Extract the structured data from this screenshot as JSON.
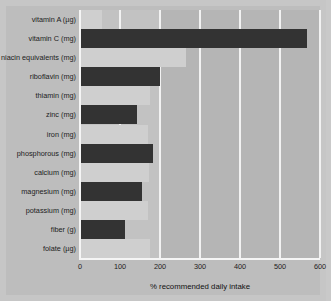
{
  "chart_data": {
    "type": "bar",
    "orientation": "horizontal",
    "title": "",
    "xlabel": "% recommended daily intake",
    "ylabel": "",
    "xlim": [
      0,
      600
    ],
    "xticks": [
      0,
      100,
      200,
      300,
      400,
      500,
      600
    ],
    "grid": true,
    "legend": "none",
    "categories": [
      "vitamin A (µg)",
      "vitamin C (mg)",
      "niacin equivalents (mg)",
      "riboflavin (mg)",
      "thiamin (mg)",
      "zinc (mg)",
      "iron (mg)",
      "phosphorous (mg)",
      "calcium (mg)",
      "magnesium (mg)",
      "potassium (mg)",
      "fiber (g)",
      "folate (µg)"
    ],
    "values": [
      55,
      568,
      265,
      200,
      175,
      143,
      170,
      183,
      172,
      155,
      170,
      112,
      175
    ],
    "bar_shades": [
      "light",
      "dark",
      "light",
      "dark",
      "light",
      "dark",
      "light",
      "dark",
      "light",
      "dark",
      "light",
      "dark",
      "light"
    ],
    "colors": {
      "dark_bar": "#333333",
      "light_bar": "#cfcfcf",
      "plot_background": "#b5b5b5",
      "band_background": "#c2c2c2",
      "gridline": "#f2f2f2",
      "page_background": "#bdbdbd",
      "text": "#1c1c1c"
    }
  }
}
